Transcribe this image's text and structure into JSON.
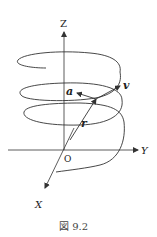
{
  "figure": {
    "caption": "図 9.2",
    "axes": {
      "z_label": "Z",
      "y_label": "Y",
      "x_label": "X",
      "origin_label": "O"
    },
    "vectors": {
      "position": "r",
      "velocity": "v",
      "acceleration": "a"
    },
    "curve": "helix"
  },
  "colors": {
    "line": "#333333",
    "background": "#ffffff"
  }
}
